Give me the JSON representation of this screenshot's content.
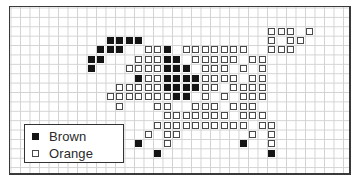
{
  "title": "",
  "grid": {
    "columns": 36,
    "rows": 18
  },
  "legend": {
    "items": [
      {
        "label": "Brown",
        "color": "#141414",
        "style": "filled"
      },
      {
        "label": "Orange",
        "color": "#ffffff",
        "style": "outlined"
      }
    ]
  },
  "pattern": {
    "description": "Pixel/cross-stitch style grid pattern of a leaping animal figure; col/row are grid cell indices",
    "cells": [
      {
        "row": 2,
        "col": 27,
        "color": "orange"
      },
      {
        "row": 2,
        "col": 28,
        "color": "orange"
      },
      {
        "row": 2,
        "col": 29,
        "color": "orange"
      },
      {
        "row": 2,
        "col": 31,
        "color": "orange"
      },
      {
        "row": 3,
        "col": 10,
        "color": "brown"
      },
      {
        "row": 3,
        "col": 11,
        "color": "brown"
      },
      {
        "row": 3,
        "col": 12,
        "color": "brown"
      },
      {
        "row": 3,
        "col": 13,
        "color": "brown"
      },
      {
        "row": 3,
        "col": 27,
        "color": "orange"
      },
      {
        "row": 3,
        "col": 29,
        "color": "orange"
      },
      {
        "row": 3,
        "col": 30,
        "color": "orange"
      },
      {
        "row": 4,
        "col": 9,
        "color": "brown"
      },
      {
        "row": 4,
        "col": 10,
        "color": "brown"
      },
      {
        "row": 4,
        "col": 11,
        "color": "brown"
      },
      {
        "row": 4,
        "col": 14,
        "color": "orange"
      },
      {
        "row": 4,
        "col": 15,
        "color": "orange"
      },
      {
        "row": 4,
        "col": 16,
        "color": "brown"
      },
      {
        "row": 4,
        "col": 18,
        "color": "orange"
      },
      {
        "row": 4,
        "col": 19,
        "color": "orange"
      },
      {
        "row": 4,
        "col": 20,
        "color": "orange"
      },
      {
        "row": 4,
        "col": 21,
        "color": "orange"
      },
      {
        "row": 4,
        "col": 22,
        "color": "orange"
      },
      {
        "row": 4,
        "col": 23,
        "color": "orange"
      },
      {
        "row": 4,
        "col": 24,
        "color": "orange"
      },
      {
        "row": 4,
        "col": 27,
        "color": "orange"
      },
      {
        "row": 4,
        "col": 28,
        "color": "orange"
      },
      {
        "row": 4,
        "col": 29,
        "color": "orange"
      },
      {
        "row": 5,
        "col": 8,
        "color": "brown"
      },
      {
        "row": 5,
        "col": 9,
        "color": "brown"
      },
      {
        "row": 5,
        "col": 13,
        "color": "orange"
      },
      {
        "row": 5,
        "col": 14,
        "color": "orange"
      },
      {
        "row": 5,
        "col": 15,
        "color": "orange"
      },
      {
        "row": 5,
        "col": 16,
        "color": "brown"
      },
      {
        "row": 5,
        "col": 17,
        "color": "brown"
      },
      {
        "row": 5,
        "col": 19,
        "color": "orange"
      },
      {
        "row": 5,
        "col": 20,
        "color": "orange"
      },
      {
        "row": 5,
        "col": 21,
        "color": "orange"
      },
      {
        "row": 5,
        "col": 22,
        "color": "orange"
      },
      {
        "row": 5,
        "col": 23,
        "color": "orange"
      },
      {
        "row": 5,
        "col": 25,
        "color": "orange"
      },
      {
        "row": 5,
        "col": 26,
        "color": "orange"
      },
      {
        "row": 6,
        "col": 8,
        "color": "brown"
      },
      {
        "row": 6,
        "col": 12,
        "color": "orange"
      },
      {
        "row": 6,
        "col": 13,
        "color": "orange"
      },
      {
        "row": 6,
        "col": 14,
        "color": "orange"
      },
      {
        "row": 6,
        "col": 15,
        "color": "orange"
      },
      {
        "row": 6,
        "col": 16,
        "color": "brown"
      },
      {
        "row": 6,
        "col": 17,
        "color": "brown"
      },
      {
        "row": 6,
        "col": 18,
        "color": "brown"
      },
      {
        "row": 6,
        "col": 20,
        "color": "orange"
      },
      {
        "row": 6,
        "col": 21,
        "color": "orange"
      },
      {
        "row": 6,
        "col": 22,
        "color": "orange"
      },
      {
        "row": 6,
        "col": 24,
        "color": "orange"
      },
      {
        "row": 6,
        "col": 26,
        "color": "orange"
      },
      {
        "row": 7,
        "col": 13,
        "color": "brown"
      },
      {
        "row": 7,
        "col": 14,
        "color": "orange"
      },
      {
        "row": 7,
        "col": 15,
        "color": "orange"
      },
      {
        "row": 7,
        "col": 16,
        "color": "brown"
      },
      {
        "row": 7,
        "col": 17,
        "color": "brown"
      },
      {
        "row": 7,
        "col": 18,
        "color": "brown"
      },
      {
        "row": 7,
        "col": 19,
        "color": "brown"
      },
      {
        "row": 7,
        "col": 20,
        "color": "orange"
      },
      {
        "row": 7,
        "col": 21,
        "color": "orange"
      },
      {
        "row": 7,
        "col": 22,
        "color": "orange"
      },
      {
        "row": 7,
        "col": 23,
        "color": "orange"
      },
      {
        "row": 7,
        "col": 25,
        "color": "orange"
      },
      {
        "row": 7,
        "col": 26,
        "color": "orange"
      },
      {
        "row": 8,
        "col": 11,
        "color": "orange"
      },
      {
        "row": 8,
        "col": 12,
        "color": "orange"
      },
      {
        "row": 8,
        "col": 13,
        "color": "orange"
      },
      {
        "row": 8,
        "col": 14,
        "color": "orange"
      },
      {
        "row": 8,
        "col": 15,
        "color": "orange"
      },
      {
        "row": 8,
        "col": 16,
        "color": "brown"
      },
      {
        "row": 8,
        "col": 17,
        "color": "brown"
      },
      {
        "row": 8,
        "col": 18,
        "color": "brown"
      },
      {
        "row": 8,
        "col": 19,
        "color": "brown"
      },
      {
        "row": 8,
        "col": 20,
        "color": "orange"
      },
      {
        "row": 8,
        "col": 21,
        "color": "orange"
      },
      {
        "row": 8,
        "col": 23,
        "color": "orange"
      },
      {
        "row": 8,
        "col": 24,
        "color": "orange"
      },
      {
        "row": 8,
        "col": 25,
        "color": "orange"
      },
      {
        "row": 8,
        "col": 26,
        "color": "orange"
      },
      {
        "row": 9,
        "col": 10,
        "color": "orange"
      },
      {
        "row": 9,
        "col": 11,
        "color": "orange"
      },
      {
        "row": 9,
        "col": 12,
        "color": "orange"
      },
      {
        "row": 9,
        "col": 13,
        "color": "orange"
      },
      {
        "row": 9,
        "col": 14,
        "color": "orange"
      },
      {
        "row": 9,
        "col": 15,
        "color": "orange"
      },
      {
        "row": 9,
        "col": 16,
        "color": "orange"
      },
      {
        "row": 9,
        "col": 17,
        "color": "brown"
      },
      {
        "row": 9,
        "col": 18,
        "color": "brown"
      },
      {
        "row": 9,
        "col": 20,
        "color": "orange"
      },
      {
        "row": 9,
        "col": 22,
        "color": "orange"
      },
      {
        "row": 9,
        "col": 24,
        "color": "orange"
      },
      {
        "row": 9,
        "col": 25,
        "color": "orange"
      },
      {
        "row": 9,
        "col": 26,
        "color": "orange"
      },
      {
        "row": 10,
        "col": 11,
        "color": "orange"
      },
      {
        "row": 10,
        "col": 15,
        "color": "orange"
      },
      {
        "row": 10,
        "col": 16,
        "color": "orange"
      },
      {
        "row": 10,
        "col": 19,
        "color": "orange"
      },
      {
        "row": 10,
        "col": 20,
        "color": "orange"
      },
      {
        "row": 10,
        "col": 21,
        "color": "orange"
      },
      {
        "row": 10,
        "col": 23,
        "color": "orange"
      },
      {
        "row": 10,
        "col": 24,
        "color": "orange"
      },
      {
        "row": 10,
        "col": 25,
        "color": "orange"
      },
      {
        "row": 11,
        "col": 16,
        "color": "orange"
      },
      {
        "row": 11,
        "col": 17,
        "color": "orange"
      },
      {
        "row": 11,
        "col": 18,
        "color": "orange"
      },
      {
        "row": 11,
        "col": 19,
        "color": "orange"
      },
      {
        "row": 11,
        "col": 20,
        "color": "orange"
      },
      {
        "row": 11,
        "col": 21,
        "color": "orange"
      },
      {
        "row": 11,
        "col": 22,
        "color": "orange"
      },
      {
        "row": 11,
        "col": 24,
        "color": "orange"
      },
      {
        "row": 11,
        "col": 25,
        "color": "orange"
      },
      {
        "row": 11,
        "col": 26,
        "color": "orange"
      },
      {
        "row": 12,
        "col": 15,
        "color": "orange"
      },
      {
        "row": 12,
        "col": 16,
        "color": "orange"
      },
      {
        "row": 12,
        "col": 17,
        "color": "orange"
      },
      {
        "row": 12,
        "col": 18,
        "color": "orange"
      },
      {
        "row": 12,
        "col": 19,
        "color": "orange"
      },
      {
        "row": 12,
        "col": 20,
        "color": "orange"
      },
      {
        "row": 12,
        "col": 21,
        "color": "orange"
      },
      {
        "row": 12,
        "col": 22,
        "color": "orange"
      },
      {
        "row": 12,
        "col": 23,
        "color": "orange"
      },
      {
        "row": 12,
        "col": 24,
        "color": "orange"
      },
      {
        "row": 12,
        "col": 26,
        "color": "orange"
      },
      {
        "row": 12,
        "col": 27,
        "color": "orange"
      },
      {
        "row": 13,
        "col": 14,
        "color": "orange"
      },
      {
        "row": 13,
        "col": 16,
        "color": "orange"
      },
      {
        "row": 13,
        "col": 17,
        "color": "orange"
      },
      {
        "row": 13,
        "col": 25,
        "color": "orange"
      },
      {
        "row": 13,
        "col": 27,
        "color": "orange"
      },
      {
        "row": 14,
        "col": 13,
        "color": "brown"
      },
      {
        "row": 14,
        "col": 16,
        "color": "orange"
      },
      {
        "row": 14,
        "col": 24,
        "color": "brown"
      },
      {
        "row": 14,
        "col": 27,
        "color": "orange"
      },
      {
        "row": 15,
        "col": 15,
        "color": "brown"
      },
      {
        "row": 15,
        "col": 27,
        "color": "brown"
      }
    ]
  }
}
